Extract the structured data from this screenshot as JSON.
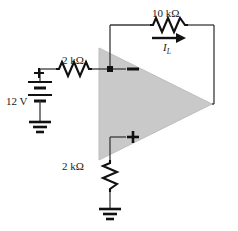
{
  "figure": {
    "name": "inverting-opamp-load-current-circuit",
    "background_color": "#ffffff",
    "wire_color": "#3a3a3a",
    "opamp_fill_color": "#c9c9c9",
    "opamp_stroke_color": "#b0b0b0",
    "text_color": "#1a1a1a"
  },
  "labels": {
    "feedback_resistor": "10 kΩ",
    "input_resistor": "2 kΩ",
    "ground_resistor": "2 kΩ",
    "source_voltage": "12 V",
    "load_current_symbol": "I",
    "load_current_subscript": "L",
    "source_polarity": "+",
    "inverting_input": "−",
    "noninverting_input": "+"
  },
  "components": {
    "feedback_resistor": {
      "value": "10 kΩ",
      "orientation": "horizontal"
    },
    "input_resistor": {
      "value": "2 kΩ",
      "orientation": "horizontal"
    },
    "ground_resistor": {
      "value": "2 kΩ",
      "orientation": "vertical"
    },
    "voltage_source": {
      "value": "12 V",
      "type": "battery",
      "cells": 2,
      "positive_terminal": "top"
    },
    "opamp": {
      "type": "operational-amplifier",
      "shape": "triangle",
      "inputs": [
        "−",
        "+"
      ]
    },
    "grounds": [
      "source-ground",
      "resistor-ground"
    ],
    "current_arrow": {
      "label": "I_L",
      "direction": "right"
    },
    "node_dots": [
      "inverting-input-node"
    ]
  }
}
